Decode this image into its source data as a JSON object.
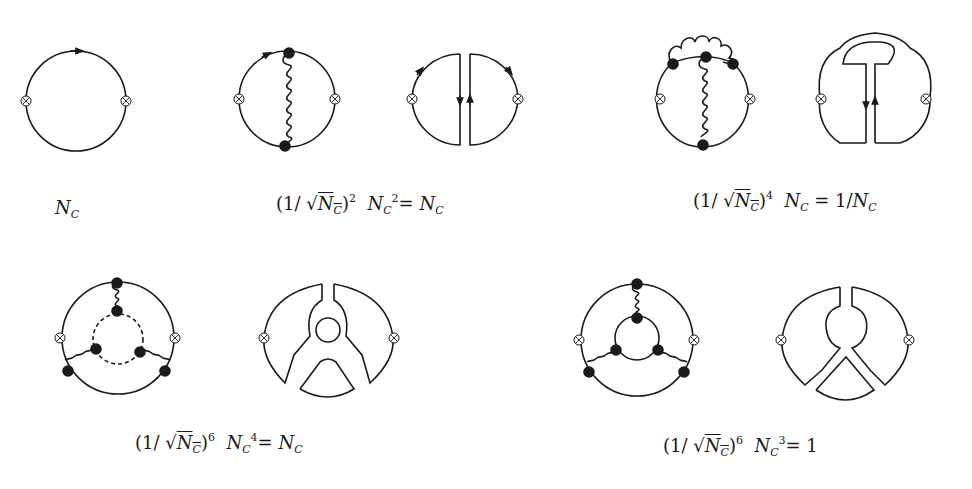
{
  "figure": {
    "stroke_color": "#1a1a1a",
    "background": "#ffffff"
  },
  "diagrams": [
    {
      "id": "d1",
      "type": "quark-loop",
      "gluons": 0,
      "label": {
        "prefix": "",
        "power": "",
        "nc_factor": "N",
        "nc_sub": "C",
        "nc_sup": "",
        "result": ""
      }
    },
    {
      "id": "d2",
      "type": "quark-loop-one-gluon",
      "gluons": 1,
      "double_line": true,
      "label": {
        "prefix": "(1/ √",
        "nc": "N",
        "nc_sub": "C",
        "power": "2",
        "factor_sup": "2",
        "result": "N",
        "result_sub": "C"
      }
    },
    {
      "id": "d3",
      "type": "quark-loop-two-gluons-crossed-rainbow",
      "gluons": 2,
      "double_line": true,
      "label": {
        "prefix": "(1/ √",
        "nc": "N",
        "nc_sub": "C",
        "power": "4",
        "factor_sup": "",
        "result": "1/N",
        "result_sub": "C"
      }
    },
    {
      "id": "d4",
      "type": "quark-loop-three-gluon-with-gluon-loop",
      "gluons": 3,
      "double_line": true,
      "label": {
        "prefix": "(1/ √",
        "nc": "N",
        "nc_sub": "C",
        "power": "6",
        "factor_sup": "4",
        "result": "N",
        "result_sub": "C"
      }
    },
    {
      "id": "d5",
      "type": "quark-loop-three-gluon-with-quark-loop",
      "gluons": 3,
      "double_line": true,
      "label": {
        "prefix": "(1/ √",
        "nc": "N",
        "nc_sub": "C",
        "power": "6",
        "factor_sup": "3",
        "result": "1",
        "result_sub": ""
      }
    }
  ],
  "labels": {
    "l1": {
      "main": "N",
      "sub": "C"
    },
    "l2": {
      "open": "(1/ √",
      "n": "N",
      "nsub": "C",
      "close": ")",
      "pow": "2",
      "n2": "N",
      "n2sub": "C",
      "n2sup": "2",
      "eq": "= ",
      "r": "N",
      "rsub": "C"
    },
    "l3": {
      "open": "(1/ √",
      "n": "N",
      "nsub": "C",
      "close": ")",
      "pow": "4",
      "n2": "N",
      "n2sub": "C",
      "eq": " = 1/",
      "r": "N",
      "rsub": "C"
    },
    "l4": {
      "open": "(1/ √",
      "n": "N",
      "nsub": "C",
      "close": ")",
      "pow": "6",
      "n2": "N",
      "n2sub": "C",
      "n2sup": "4",
      "eq": "= ",
      "r": "N",
      "rsub": "C"
    },
    "l5": {
      "open": "(1/ √",
      "n": "N",
      "nsub": "C",
      "close": ")",
      "pow": "6",
      "n2": "N",
      "n2sub": "C",
      "n2sup": "3",
      "eq": "= 1"
    }
  }
}
